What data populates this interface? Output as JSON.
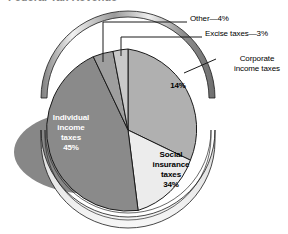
{
  "figure": {
    "title_fragment": "Federal Tax Revenue",
    "background_color": "#ffffff"
  },
  "chart_data": {
    "type": "pie",
    "title": "Federal Tax Revenue",
    "xlabel": "",
    "ylabel": "",
    "legend_position": "none",
    "grid": false,
    "categories": [
      "Individual income taxes",
      "Social insurance taxes",
      "Corporate income taxes",
      "Excise taxes",
      "Other"
    ],
    "values": [
      45,
      34,
      14,
      3,
      4
    ],
    "value_labels": [
      "45%",
      "34%",
      "14%",
      "3%",
      "4%"
    ],
    "slice_colors": [
      "#8a8a8a",
      "#ececec",
      "#b0b0b0",
      "#c9c9c9",
      "#9e9e9e"
    ],
    "annotations": [
      {
        "text": "Other—4%",
        "placement": "leader-line-top"
      },
      {
        "text": "Excise taxes—3%",
        "placement": "leader-line-top-right"
      },
      {
        "text": "Corporate income taxes",
        "placement": "leader-line-right"
      }
    ]
  },
  "callouts": {
    "other": "Other—4%",
    "excise": "Excise taxes—3%",
    "corporate": "Corporate income taxes"
  },
  "slice_labels": {
    "individual": "Individual\nincome\ntaxes\n45%",
    "individual_name": "Individual income taxes",
    "individual_pct": "45%",
    "social": "Social\ninsurance\ntaxes\n34%",
    "social_name": "Social insurance taxes",
    "social_pct": "34%",
    "corporate_pct": "14%"
  },
  "colors": {
    "individual": "#8a8a8a",
    "social": "#ececec",
    "corporate": "#b0b0b0",
    "excise": "#c9c9c9",
    "other": "#9e9e9e",
    "shadow": "#878787",
    "outline": "#1a1a1a",
    "rim_light": "#f2f2f2",
    "rim_dark": "#7d7d7d"
  }
}
